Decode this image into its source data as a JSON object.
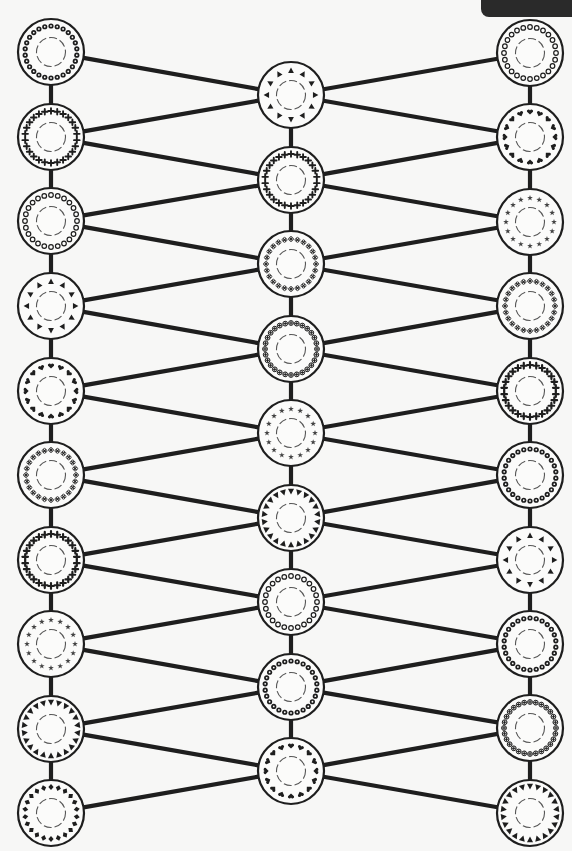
{
  "puzzle": {
    "type": "pattern-matching-network",
    "node_radius": 33,
    "stroke_color": "#1e1e1e",
    "background": "#f7f7f6",
    "columns": {
      "left": {
        "x": 51,
        "nodes": [
          {
            "y": 52,
            "pattern": "flower"
          },
          {
            "y": 137,
            "pattern": "cross"
          },
          {
            "y": 221,
            "pattern": "ring"
          },
          {
            "y": 306,
            "pattern": "triangle-sparse"
          },
          {
            "y": 391,
            "pattern": "heart"
          },
          {
            "y": 475,
            "pattern": "clover"
          },
          {
            "y": 560,
            "pattern": "cross-dark"
          },
          {
            "y": 644,
            "pattern": "star"
          },
          {
            "y": 729,
            "pattern": "triangle-dense"
          },
          {
            "y": 813,
            "pattern": "diamond"
          }
        ]
      },
      "middle": {
        "x": 291,
        "nodes": [
          {
            "y": 95,
            "pattern": "triangle-sparse"
          },
          {
            "y": 180,
            "pattern": "cross"
          },
          {
            "y": 264,
            "pattern": "clover"
          },
          {
            "y": 349,
            "pattern": "flower-cross"
          },
          {
            "y": 433,
            "pattern": "star"
          },
          {
            "y": 518,
            "pattern": "triangle-dense"
          },
          {
            "y": 602,
            "pattern": "ring"
          },
          {
            "y": 687,
            "pattern": "flower"
          },
          {
            "y": 771,
            "pattern": "heart"
          }
        ]
      },
      "right": {
        "x": 530,
        "nodes": [
          {
            "y": 53,
            "pattern": "ring"
          },
          {
            "y": 137,
            "pattern": "heart"
          },
          {
            "y": 222,
            "pattern": "star"
          },
          {
            "y": 306,
            "pattern": "clover"
          },
          {
            "y": 391,
            "pattern": "cross-dark"
          },
          {
            "y": 475,
            "pattern": "flower"
          },
          {
            "y": 560,
            "pattern": "triangle-sparse"
          },
          {
            "y": 644,
            "pattern": "flower"
          },
          {
            "y": 728,
            "pattern": "flower-cross"
          },
          {
            "y": 813,
            "pattern": "triangle-dense"
          }
        ]
      }
    }
  }
}
